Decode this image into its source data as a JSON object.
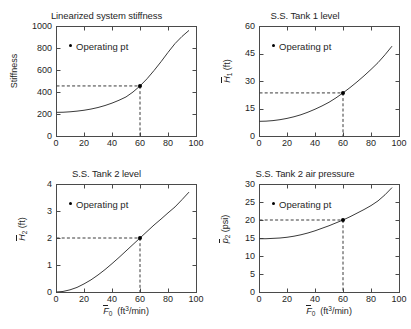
{
  "figure": {
    "width": 405,
    "height": 329,
    "background": "#ffffff",
    "line_color": "#3a3a3a",
    "marker_color": "#000000",
    "dash_color": "#3a3a3a"
  },
  "legend_label": "Operating pt",
  "xlabel_html": "F0 (ft3/min)",
  "panels": [
    {
      "key": "stiffness",
      "title": "Linearized system stiffness",
      "ylabel": "Stiffness",
      "ylabel_units": "",
      "xticks": [
        0,
        20,
        40,
        60,
        80,
        100
      ],
      "yticks": [
        0,
        200,
        400,
        600,
        800,
        1000
      ],
      "xlim": [
        0,
        100
      ],
      "ylim": [
        0,
        1000
      ],
      "operating_point": {
        "x": 60,
        "y": 455
      },
      "show_xticklabels": true,
      "show_xlabel": false
    },
    {
      "key": "tank1_level",
      "title": "S.S. Tank 1 level",
      "ylabel": "H1",
      "ylabel_units": "(ft)",
      "xticks": [
        0,
        20,
        40,
        60,
        80,
        100
      ],
      "yticks": [
        0,
        15,
        30,
        45,
        60
      ],
      "xlim": [
        0,
        100
      ],
      "ylim": [
        0,
        60
      ],
      "operating_point": {
        "x": 60,
        "y": 23.5
      },
      "show_xticklabels": true,
      "show_xlabel": false
    },
    {
      "key": "tank2_level",
      "title": "S.S. Tank 2 level",
      "ylabel": "H2",
      "ylabel_units": "(ft)",
      "xticks": [
        0,
        20,
        40,
        60,
        80,
        100
      ],
      "yticks": [
        0,
        1,
        2,
        3,
        4
      ],
      "xlim": [
        0,
        100
      ],
      "ylim": [
        0,
        4
      ],
      "operating_point": {
        "x": 60,
        "y": 2.0
      },
      "show_xticklabels": true,
      "show_xlabel": true
    },
    {
      "key": "tank2_pressure",
      "title": "S.S. Tank 2 air pressure",
      "ylabel": "p2",
      "ylabel_units": "(psi)",
      "xticks": [
        0,
        20,
        40,
        60,
        80,
        100
      ],
      "yticks": [
        0,
        5,
        10,
        15,
        20,
        25,
        30
      ],
      "xlim": [
        0,
        100
      ],
      "ylim": [
        0,
        30
      ],
      "operating_point": {
        "x": 60,
        "y": 20.0
      },
      "show_xticklabels": true,
      "show_xlabel": true
    }
  ],
  "chart_data": [
    {
      "type": "line",
      "title": "Linearized system stiffness",
      "xlabel": "F̅0 (ft³/min)",
      "ylabel": "Stiffness",
      "xlim": [
        0,
        100
      ],
      "ylim": [
        0,
        1000
      ],
      "xticks": [
        0,
        20,
        40,
        60,
        80,
        100
      ],
      "yticks": [
        0,
        200,
        400,
        600,
        800,
        1000
      ],
      "grid": false,
      "legend": [
        "Operating pt"
      ],
      "legend_position": "upper left inside",
      "annotations": [
        {
          "label": "Operating pt",
          "x": 60,
          "y": 455,
          "marker": "dot",
          "guides": "dashed to axes"
        }
      ],
      "series": [
        {
          "name": "Stiffness",
          "x": [
            0,
            5,
            10,
            15,
            20,
            25,
            30,
            35,
            40,
            45,
            50,
            55,
            60,
            65,
            70,
            75,
            80,
            85,
            90,
            95
          ],
          "y": [
            215,
            216,
            220,
            226,
            234,
            245,
            259,
            277,
            299,
            325,
            355,
            400,
            455,
            520,
            595,
            675,
            760,
            840,
            905,
            960
          ]
        }
      ]
    },
    {
      "type": "line",
      "title": "S.S. Tank 1 level",
      "xlabel": "F̅0 (ft³/min)",
      "ylabel": "H̅1 (ft)",
      "xlim": [
        0,
        100
      ],
      "ylim": [
        0,
        60
      ],
      "xticks": [
        0,
        20,
        40,
        60,
        80,
        100
      ],
      "yticks": [
        0,
        15,
        30,
        45,
        60
      ],
      "grid": false,
      "legend": [
        "Operating pt"
      ],
      "legend_position": "upper left inside",
      "annotations": [
        {
          "label": "Operating pt",
          "x": 60,
          "y": 23.5,
          "marker": "dot",
          "guides": "dashed to axes"
        }
      ],
      "series": [
        {
          "name": "Tank 1 level",
          "x": [
            0,
            5,
            10,
            15,
            20,
            25,
            30,
            35,
            40,
            45,
            50,
            55,
            60,
            65,
            70,
            75,
            80,
            85,
            90,
            95
          ],
          "y": [
            8.0,
            8.1,
            8.4,
            8.9,
            9.6,
            10.5,
            11.6,
            13.0,
            14.6,
            16.4,
            18.4,
            20.8,
            23.5,
            26.4,
            29.5,
            32.8,
            36.3,
            40.0,
            44.3,
            49.0
          ]
        }
      ]
    },
    {
      "type": "line",
      "title": "S.S. Tank 2 level",
      "xlabel": "F̅0 (ft³/min)",
      "ylabel": "H̅2 (ft)",
      "xlim": [
        0,
        100
      ],
      "ylim": [
        0,
        4
      ],
      "xticks": [
        0,
        20,
        40,
        60,
        80,
        100
      ],
      "yticks": [
        0,
        1,
        2,
        3,
        4
      ],
      "grid": false,
      "legend": [
        "Operating pt"
      ],
      "legend_position": "upper left inside",
      "annotations": [
        {
          "label": "Operating pt",
          "x": 60,
          "y": 2.0,
          "marker": "dot",
          "guides": "dashed to axes"
        }
      ],
      "series": [
        {
          "name": "Tank 2 level",
          "x": [
            0,
            5,
            10,
            15,
            20,
            25,
            30,
            35,
            40,
            45,
            50,
            55,
            60,
            65,
            70,
            75,
            80,
            85,
            90,
            95
          ],
          "y": [
            0.0,
            0.02,
            0.08,
            0.17,
            0.3,
            0.45,
            0.63,
            0.83,
            1.05,
            1.28,
            1.52,
            1.76,
            2.0,
            2.24,
            2.48,
            2.7,
            2.93,
            3.15,
            3.42,
            3.7
          ]
        }
      ]
    },
    {
      "type": "line",
      "title": "S.S. Tank 2 air pressure",
      "xlabel": "F̅0 (ft³/min)",
      "ylabel": "p̅2 (psi)",
      "xlim": [
        0,
        100
      ],
      "ylim": [
        0,
        30
      ],
      "xticks": [
        0,
        20,
        40,
        60,
        80,
        100
      ],
      "yticks": [
        0,
        5,
        10,
        15,
        20,
        25,
        30
      ],
      "grid": false,
      "legend": [
        "Operating pt"
      ],
      "legend_position": "upper left inside",
      "annotations": [
        {
          "label": "Operating pt",
          "x": 60,
          "y": 20.0,
          "marker": "dot",
          "guides": "dashed to axes"
        }
      ],
      "series": [
        {
          "name": "Tank 2 air pressure",
          "x": [
            0,
            5,
            10,
            15,
            20,
            25,
            30,
            35,
            40,
            45,
            50,
            55,
            60,
            65,
            70,
            75,
            80,
            85,
            90,
            95
          ],
          "y": [
            14.8,
            14.8,
            14.9,
            15.0,
            15.2,
            15.5,
            15.9,
            16.4,
            17.0,
            17.7,
            18.4,
            19.2,
            20.0,
            20.9,
            21.9,
            22.9,
            24.0,
            25.3,
            27.0,
            29.0
          ]
        }
      ]
    }
  ]
}
